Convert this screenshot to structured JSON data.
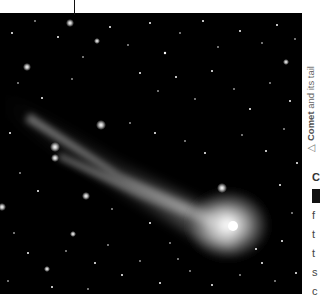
{
  "figure": {
    "colors": {
      "sky": "#000000",
      "coma": "#e8e8e8",
      "tail": "#bdbdbd",
      "stars": "#ffffff",
      "page": "#ffffff",
      "leader_line": "#111111"
    }
  },
  "caption": {
    "marker": "△",
    "bold": "Comet",
    "rest": " and its tail"
  },
  "body_text_fragments": {
    "line1": "C",
    "line3": "f",
    "line4": "t",
    "line5": "t",
    "line6": "s",
    "line7": "c"
  }
}
